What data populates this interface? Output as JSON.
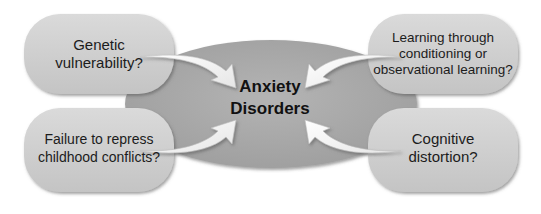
{
  "diagram": {
    "center": {
      "title": "Anxiety Disorders",
      "line1": "Anxiety",
      "line2": "Disorders"
    },
    "factors": [
      {
        "id": "top-left",
        "line1": "Genetic",
        "line2": "vulnerability?",
        "text": "Genetic vulnerability?"
      },
      {
        "id": "top-right",
        "line1": "Learning through",
        "line2": "conditioning or",
        "line3": "observational learning?",
        "text": "Learning through conditioning or observational learning?"
      },
      {
        "id": "bottom-left",
        "line1": "Failure to repress",
        "line2": "childhood conflicts?",
        "text": "Failure to repress childhood conflicts?"
      },
      {
        "id": "bottom-right",
        "line1": "Cognitive",
        "line2": "distortion?",
        "text": "Cognitive distortion?"
      }
    ],
    "colors": {
      "ellipse": "#a8a8a8",
      "box": "#cfcfcf",
      "arrow": "#f4f4f4",
      "text": "#1c1c1c"
    }
  }
}
